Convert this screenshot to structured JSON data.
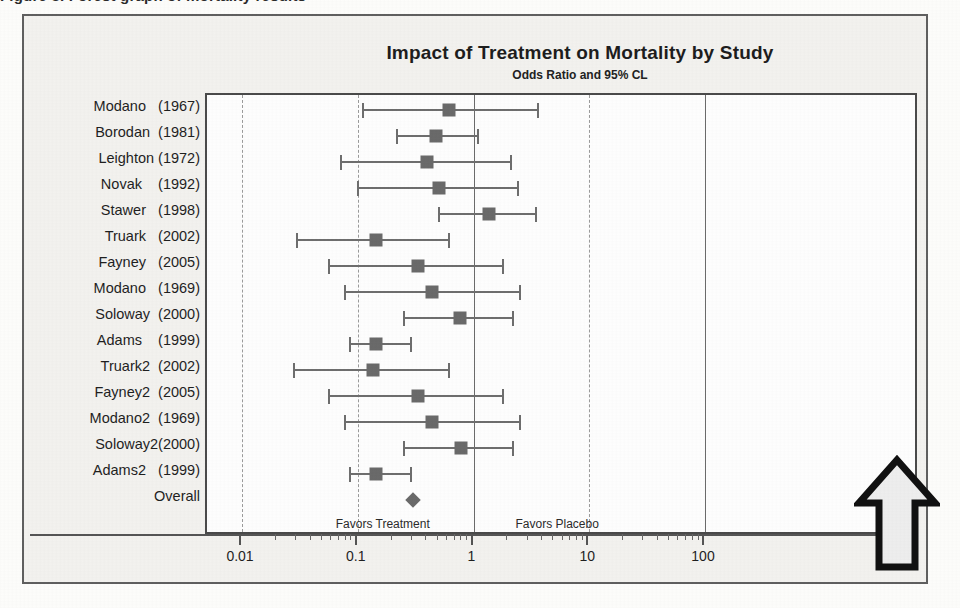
{
  "caption": {
    "text": "Figure 3.  Forest graph of mortality results"
  },
  "chart_data": {
    "type": "forest",
    "title": "Impact of Treatment on Mortality by Study",
    "subtitle": "Odds Ratio and 95% CL",
    "xlabel": "",
    "ylabel": "",
    "xscale": "log",
    "xlim": [
      0.01,
      100
    ],
    "grid": true,
    "reference_line": 1,
    "tick_labels": [
      "0.01",
      "0.1",
      "1",
      "10",
      "100"
    ],
    "tick_values": [
      0.01,
      0.1,
      1,
      10,
      100
    ],
    "left_annotation": "Favors Treatment",
    "right_annotation": "Favors Placebo",
    "marker_color": "#6a6a6a",
    "line_color": "#6e6e6e",
    "categories": [
      "Modano   (1967)",
      "Borodan  (1981)",
      "Leighton (1972)",
      "Novak    (1992)",
      "Stawer   (1998)",
      "Truark   (2002)",
      "Fayney   (2005)",
      "Modano   (1969)",
      "Soloway  (2000)",
      "Adams    (1999)",
      "Truark2  (2002)",
      "Fayney2  (2005)",
      "Modano2  (1969)",
      "Soloway2(2000)",
      "Adams2   (1999)",
      "Overall"
    ],
    "points": [
      {
        "study": "Modano   (1967)",
        "odds_ratio": 0.62,
        "ci_low": 0.11,
        "ci_high": 3.6,
        "shape": "square"
      },
      {
        "study": "Borodan  (1981)",
        "odds_ratio": 0.47,
        "ci_low": 0.22,
        "ci_high": 1.1,
        "shape": "square"
      },
      {
        "study": "Leighton (1972)",
        "odds_ratio": 0.4,
        "ci_low": 0.072,
        "ci_high": 2.1,
        "shape": "square"
      },
      {
        "study": "Novak    (1992)",
        "odds_ratio": 0.5,
        "ci_low": 0.1,
        "ci_high": 2.4,
        "shape": "square"
      },
      {
        "study": "Stawer   (1998)",
        "odds_ratio": 1.35,
        "ci_low": 0.5,
        "ci_high": 3.5,
        "shape": "square"
      },
      {
        "study": "Truark   (2002)",
        "odds_ratio": 0.145,
        "ci_low": 0.03,
        "ci_high": 0.62,
        "shape": "square"
      },
      {
        "study": "Fayney   (2005)",
        "odds_ratio": 0.33,
        "ci_low": 0.057,
        "ci_high": 1.8,
        "shape": "square"
      },
      {
        "study": "Modano   (1969)",
        "odds_ratio": 0.44,
        "ci_low": 0.077,
        "ci_high": 2.5,
        "shape": "square"
      },
      {
        "study": "Soloway  (2000)",
        "odds_ratio": 0.76,
        "ci_low": 0.25,
        "ci_high": 2.2,
        "shape": "square"
      },
      {
        "study": "Adams    (1999)",
        "odds_ratio": 0.145,
        "ci_low": 0.085,
        "ci_high": 0.29,
        "shape": "square"
      },
      {
        "study": "Truark2  (2002)",
        "odds_ratio": 0.135,
        "ci_low": 0.028,
        "ci_high": 0.62,
        "shape": "square"
      },
      {
        "study": "Fayney2  (2005)",
        "odds_ratio": 0.33,
        "ci_low": 0.057,
        "ci_high": 1.8,
        "shape": "square"
      },
      {
        "study": "Modano2  (1969)",
        "odds_ratio": 0.44,
        "ci_low": 0.077,
        "ci_high": 2.5,
        "shape": "square"
      },
      {
        "study": "Soloway2(2000)",
        "odds_ratio": 0.78,
        "ci_low": 0.25,
        "ci_high": 2.2,
        "shape": "square"
      },
      {
        "study": "Adams2   (1999)",
        "odds_ratio": 0.145,
        "ci_low": 0.085,
        "ci_high": 0.29,
        "shape": "square"
      },
      {
        "study": "Overall",
        "odds_ratio": 0.3,
        "ci_low": 0.3,
        "ci_high": 0.3,
        "shape": "diamond"
      }
    ]
  },
  "annotations": {
    "arrow": "up-arrow"
  }
}
